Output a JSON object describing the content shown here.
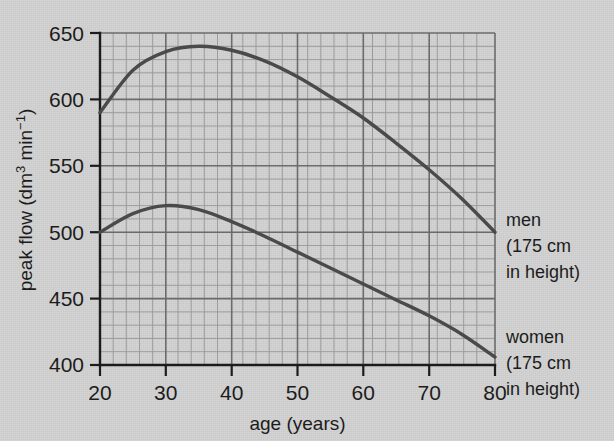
{
  "chart_data": {
    "type": "line",
    "title": "",
    "subtitle": "",
    "xlabel": "age (years)",
    "ylabel_plain": "peak flow (dm3 min-1)",
    "ylabel_parts": {
      "prefix": "peak flow (dm",
      "sup1": "3",
      "middle": " min",
      "sup2": "−1",
      "suffix": ")"
    },
    "xlim": [
      20,
      80
    ],
    "ylim": [
      400,
      650
    ],
    "xticks": [
      20,
      30,
      40,
      50,
      60,
      70,
      80
    ],
    "xtick_labels": [
      "20",
      "30",
      "40",
      "50",
      "60",
      "70",
      "80"
    ],
    "yticks": [
      400,
      450,
      500,
      550,
      600,
      650
    ],
    "ytick_labels": [
      "400",
      "450",
      "500",
      "550",
      "600",
      "650"
    ],
    "grid": true,
    "grid_major_x_step": 10,
    "grid_minor_x_step": 2,
    "grid_major_y_step": 50,
    "grid_minor_y_step": 10,
    "legend_position": "right-inline-annotations",
    "x": [
      20,
      25,
      30,
      35,
      40,
      45,
      50,
      55,
      60,
      65,
      70,
      75,
      80
    ],
    "series": [
      {
        "name": "men",
        "annotation_lines": [
          "men",
          "(175 cm",
          "in height)"
        ],
        "values": [
          590,
          622,
          636,
          640,
          637,
          629,
          617,
          602,
          586,
          567,
          547,
          525,
          500
        ]
      },
      {
        "name": "women",
        "annotation_lines": [
          "women",
          "(175 cm",
          "in height)"
        ],
        "values": [
          500,
          514,
          520,
          517,
          508,
          497,
          485,
          473,
          461,
          449,
          437,
          423,
          406
        ]
      }
    ],
    "annotations": [
      {
        "id": "men-annotation",
        "lines": [
          "men",
          "(175 cm",
          "in height)"
        ]
      },
      {
        "id": "women-annotation",
        "lines": [
          "women",
          "(175 cm",
          "in height)"
        ]
      }
    ],
    "colors": {
      "background": "#d2d2d2",
      "grid_minor": "#9a9a9a",
      "grid_major": "#6e6e6e",
      "axis": "#1c1c1c",
      "curve": "#4a4a4a",
      "text": "#1c1c1c"
    }
  }
}
